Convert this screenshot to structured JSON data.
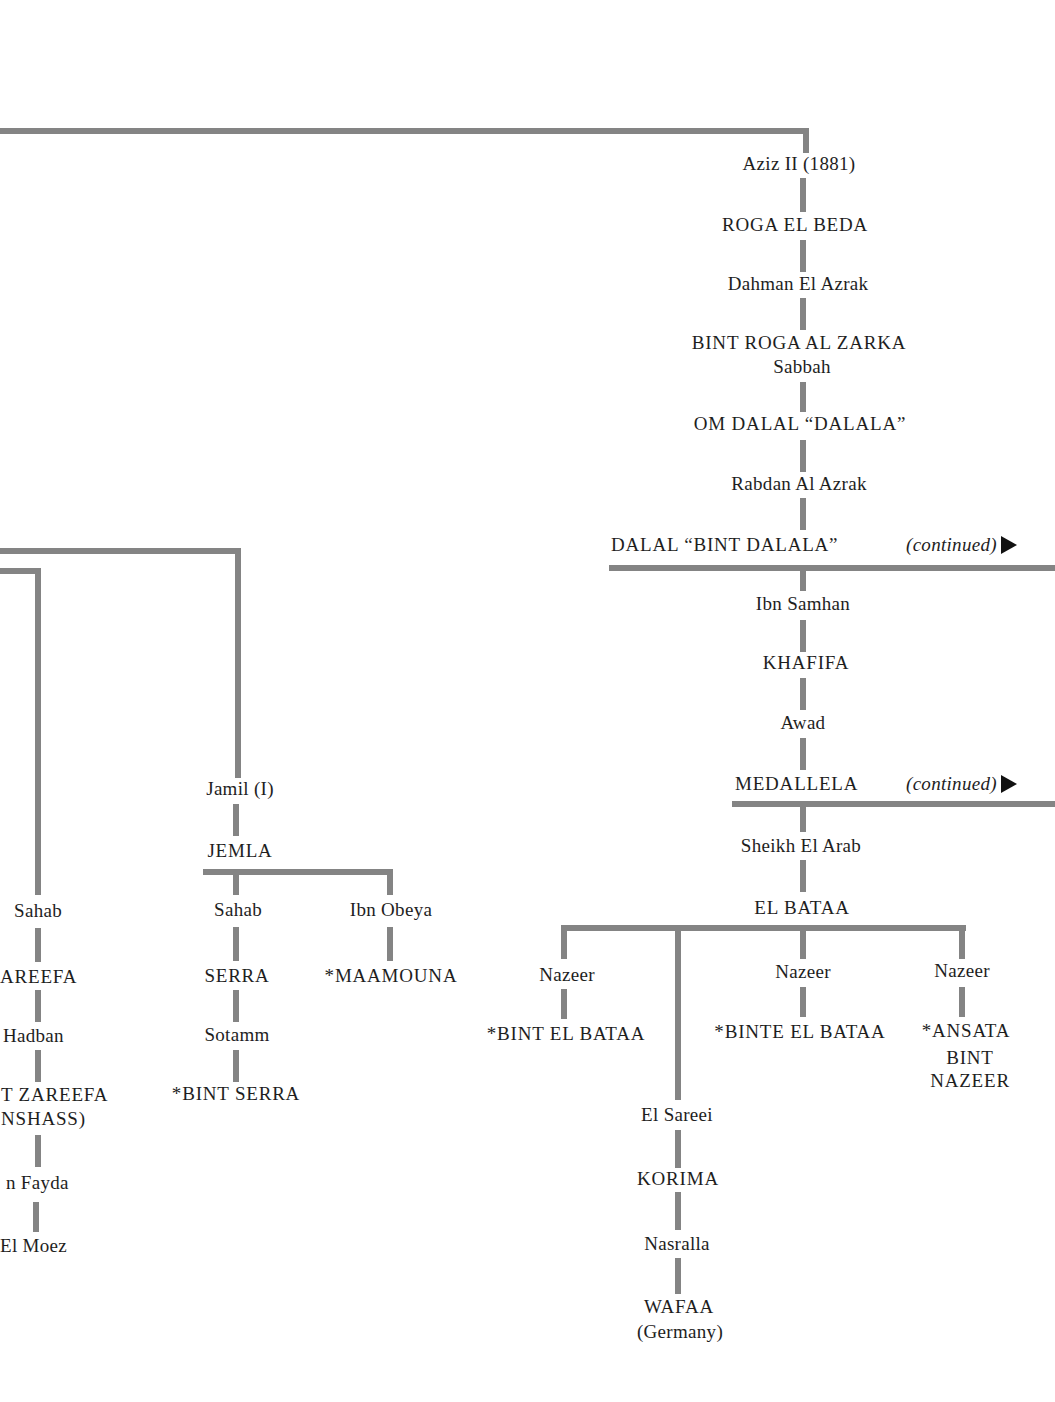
{
  "page": {
    "type": "pedigree-chart",
    "line_color": "#848484",
    "text_color": "#1e1e1e"
  },
  "main_line": {
    "nodes": [
      "Aziz II (1881)",
      "ROGA EL BEDA",
      "Dahman El Azrak",
      "BINT ROGA AL ZARKA",
      "Sabbah",
      "OM DALAL “DALALA”",
      "Rabdan Al Azrak",
      "DALAL “BINT DALALA”",
      "Ibn Samhan",
      "KHAFIFA",
      "Awad",
      "MEDALLELA",
      "Sheikh El Arab",
      "EL BATAA"
    ],
    "continued_label": "(continued)",
    "continued_arrow_icon": "right-triangle-arrow"
  },
  "el_bataa_offspring": {
    "branch1": {
      "sire": "Nazeer",
      "foal": "*BINT EL BATAA"
    },
    "branch2": {
      "sire": "El Sareei",
      "line": [
        "KORIMA",
        "Nasralla",
        "WAFAA",
        "(Germany)"
      ]
    },
    "branch3": {
      "sire": "Nazeer",
      "foal": "*BINTE EL BATAA"
    },
    "branch4": {
      "sire": "Nazeer",
      "foal_lines": [
        "*ANSATA",
        "BINT",
        "NAZEER"
      ]
    }
  },
  "jamil_line": {
    "sire": "Jamil (I)",
    "dam": "JEMLA",
    "children": [
      {
        "sire": "Sahab",
        "line": [
          "SERRA",
          "Sotamm",
          "*BINT SERRA"
        ]
      },
      {
        "sire": "Ibn Obeya",
        "line": [
          "*MAAMOUNA"
        ]
      }
    ]
  },
  "left_cutoff_line": {
    "nodes": [
      "Sahab",
      "AREEFA",
      "Hadban",
      "T ZAREEFA",
      "NSHASS)",
      "n Fayda",
      "El Moez"
    ]
  }
}
